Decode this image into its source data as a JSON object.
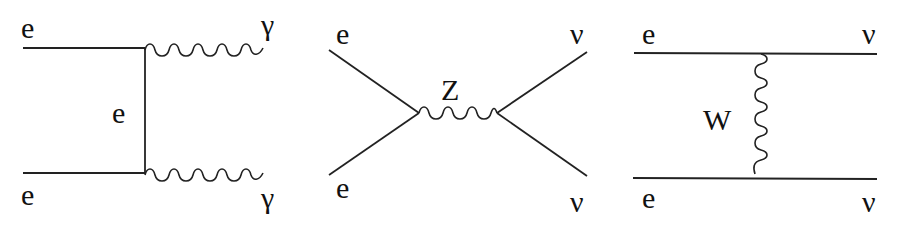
{
  "diagrams": [
    {
      "name": "compton-annihilation",
      "description": "e e -> gamma gamma via t-channel electron exchange",
      "labels": {
        "in_top": "e",
        "in_bottom": "e",
        "propagator": "e",
        "out_top": "γ",
        "out_bottom": "γ"
      }
    },
    {
      "name": "z-exchange-s-channel",
      "description": "e e -> Z -> nu nu",
      "labels": {
        "in_top": "e",
        "in_bottom": "e",
        "propagator": "Z",
        "out_top": "ν",
        "out_bottom": "ν"
      }
    },
    {
      "name": "w-exchange-t-channel",
      "description": "e e -> nu nu via W exchange",
      "labels": {
        "in_top": "e",
        "in_bottom": "e",
        "propagator": "W",
        "out_top": "ν",
        "out_bottom": "ν"
      }
    }
  ],
  "colors": {
    "stroke": "#222222",
    "text": "#111111",
    "background": "#ffffff"
  }
}
